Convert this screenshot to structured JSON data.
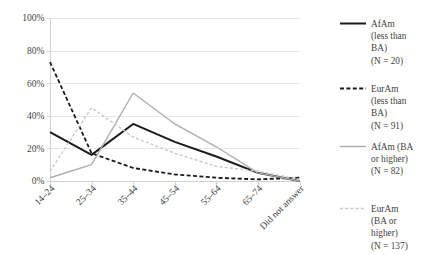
{
  "chart_data": {
    "type": "line",
    "title": "",
    "subtitle": "",
    "xlabel": "",
    "ylabel": "",
    "categories": [
      "14–24",
      "25–34",
      "35–44",
      "45–54",
      "55–64",
      "65–74",
      "Did not answer"
    ],
    "ylim": [
      0,
      100
    ],
    "yticks": [
      0,
      20,
      40,
      60,
      80,
      100
    ],
    "ytick_labels": [
      "0%",
      "20%",
      "40%",
      "60%",
      "80%",
      "100%"
    ],
    "grid": true,
    "legend_position": "right",
    "series": [
      {
        "name": "AfAm (less than BA) (N = 20)",
        "label_lines": [
          "AfAm",
          "(less than",
          "BA)",
          "(N = 20)"
        ],
        "style": "solid",
        "color": "#1a1a1a",
        "width": 2.0,
        "values": [
          30,
          16,
          35,
          24,
          15,
          5,
          0
        ]
      },
      {
        "name": "EurAm (less than BA) (N = 91)",
        "label_lines": [
          "EurAm",
          "(less than",
          "BA)",
          "(N = 91)"
        ],
        "style": "dashed",
        "color": "#1a1a1a",
        "width": 1.8,
        "values": [
          73,
          17,
          8,
          4,
          2,
          1,
          2
        ]
      },
      {
        "name": "AfAm (BA or higher) (N = 82)",
        "label_lines": [
          "AfAm (BA",
          "or higher)",
          "(N = 82)"
        ],
        "style": "solid",
        "color": "#adadad",
        "width": 1.4,
        "values": [
          2,
          10,
          54,
          35,
          21,
          5,
          0
        ]
      },
      {
        "name": "EurAm (BA or higher) (N = 137)",
        "label_lines": [
          "EurAm",
          "(BA or",
          "higher)",
          "(N = 137)"
        ],
        "style": "dashed",
        "color": "#c8c8c8",
        "width": 1.4,
        "values": [
          6,
          45,
          27,
          17,
          9,
          6,
          1
        ]
      }
    ]
  },
  "axis": {
    "ytick_labels": [
      "100%",
      "80%",
      "60%",
      "40%",
      "20%",
      "0%"
    ],
    "xtick_labels": [
      "14–24",
      "25–34",
      "35–44",
      "45–54",
      "55–64",
      "65–74",
      "Did not answer"
    ]
  },
  "legend": {
    "entries": [
      {
        "lines": [
          "AfAm",
          "(less than",
          "BA)",
          "(N = 20)"
        ],
        "swatch": "solid-dark-line-icon"
      },
      {
        "lines": [
          "EurAm",
          "(less than",
          "BA)",
          "(N = 91)"
        ],
        "swatch": "dashed-dark-line-icon"
      },
      {
        "lines": [
          "AfAm (BA",
          "or higher)",
          "(N = 82)"
        ],
        "swatch": "solid-gray-line-icon"
      },
      {
        "lines": [
          "EurAm",
          "(BA or",
          "higher)",
          "(N = 137)"
        ],
        "swatch": "dashed-light-gray-line-icon"
      }
    ]
  },
  "colors": {
    "grid": "#e8e8e8",
    "axis": "#d2d2d2",
    "text": "#3f3f3f",
    "series_dark": "#1a1a1a",
    "series_gray": "#adadad",
    "series_light_gray": "#c8c8c8",
    "background": "#ffffff"
  }
}
